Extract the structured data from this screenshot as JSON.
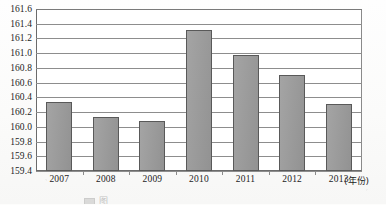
{
  "chart_data": {
    "type": "bar",
    "title": "",
    "subtitle": "",
    "xlabel": "年份",
    "ylabel": "",
    "categories": [
      "2007",
      "2008",
      "2009",
      "2010",
      "2011",
      "2012",
      "2013"
    ],
    "values": [
      160.34,
      160.13,
      160.08,
      161.31,
      160.98,
      160.7,
      160.31
    ],
    "series": [
      {
        "name": "",
        "values": [
          160.34,
          160.13,
          160.08,
          161.31,
          160.98,
          160.7,
          160.31
        ]
      }
    ],
    "ylim": [
      159.4,
      161.6
    ],
    "ytick_step": 0.2,
    "yticks": [
      "161.6",
      "161.4",
      "161.2",
      "161.0",
      "160.8",
      "160.6",
      "160.4",
      "160.2",
      "160.0",
      "159.8",
      "159.6",
      "159.4"
    ],
    "ytick_values": [
      161.6,
      161.4,
      161.2,
      161.0,
      160.8,
      160.6,
      160.4,
      160.2,
      160.0,
      159.8,
      159.6,
      159.4
    ],
    "grid": true,
    "grid_axis": "y",
    "legend": false,
    "legend_position": "none",
    "bar_color": "#9a9a9a",
    "bar_border_color": "#595959",
    "axis_color": "#6b6b6b",
    "gridline_color": "#8d8d8d",
    "plot_background": "#ffffff",
    "annotations": []
  },
  "axis": {
    "x_unit_label": "(年份)"
  },
  "caption": {
    "text": "图"
  }
}
